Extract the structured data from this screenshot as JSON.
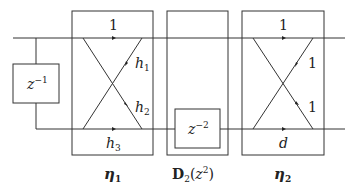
{
  "diagram": {
    "delay_left": {
      "base": "z",
      "exp": "−1"
    },
    "delay_mid": {
      "base": "z",
      "exp": "−2"
    },
    "eta1": {
      "top": "1",
      "h1": "h",
      "h1_sub": "1",
      "h2": "h",
      "h2_sub": "2",
      "bottom": "h",
      "bottom_sub": "3",
      "label": "η",
      "label_sub": "1"
    },
    "d2": {
      "label": "D",
      "label_sub": "2",
      "arg_open": "(",
      "arg_base": "z",
      "arg_exp": "2",
      "arg_close": ")"
    },
    "eta2": {
      "top": "1",
      "upper_right": "1",
      "lower_right": "1",
      "bottom": "d",
      "label": "η",
      "label_sub": "2"
    },
    "colors": {
      "stroke": "#333333",
      "background": "#ffffff"
    }
  }
}
